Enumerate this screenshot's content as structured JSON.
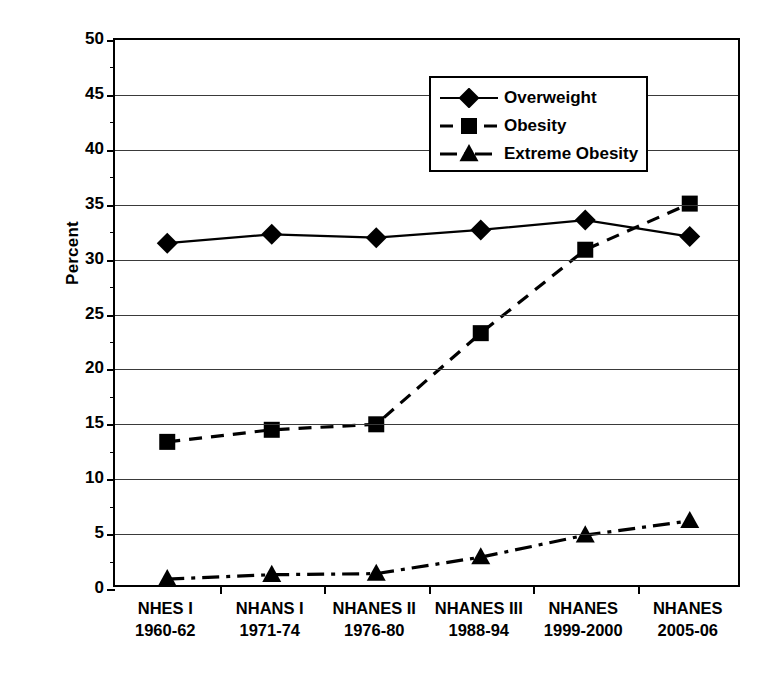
{
  "chart_data": {
    "type": "line",
    "title": "",
    "subtitle": "",
    "xlabel": "",
    "ylabel": "Percent",
    "ylim": [
      0,
      50
    ],
    "yticks": [
      0,
      5,
      10,
      15,
      20,
      25,
      30,
      35,
      40,
      45,
      50
    ],
    "ytick_labels": [
      "0",
      "5",
      "10",
      "15",
      "20",
      "25",
      "30",
      "35",
      "40",
      "45",
      "50"
    ],
    "grid": true,
    "legend_position": "upper center",
    "categories": [
      {
        "name": "NHES I",
        "years": "1960-62"
      },
      {
        "name": "NHANS I",
        "years": "1971-74"
      },
      {
        "name": "NHANES II",
        "years": "1976-80"
      },
      {
        "name": "NHANES III",
        "years": "1988-94"
      },
      {
        "name": "NHANES",
        "years": "1999-2000"
      },
      {
        "name": "NHANES",
        "years": "2005-06"
      }
    ],
    "category_labels": [
      "NHES I 1960-62",
      "NHANS I 1971-74",
      "NHANES II 1976-80",
      "NHANES III 1988-94",
      "NHANES 1999-2000",
      "NHANES 2005-06"
    ],
    "series": [
      {
        "name": "Overweight",
        "marker": "diamond",
        "linestyle": "solid",
        "color": "#000000",
        "values": [
          31.5,
          32.3,
          32.0,
          32.7,
          33.6,
          32.1
        ]
      },
      {
        "name": "Obesity",
        "marker": "square",
        "linestyle": "dashed",
        "color": "#000000",
        "values": [
          13.4,
          14.5,
          15.0,
          23.3,
          30.9,
          35.1
        ]
      },
      {
        "name": "Extreme Obesity",
        "marker": "triangle",
        "linestyle": "dashdot",
        "color": "#000000",
        "values": [
          0.9,
          1.3,
          1.4,
          2.9,
          4.9,
          6.2
        ]
      }
    ]
  },
  "legend": {
    "items": [
      {
        "label": "Overweight",
        "marker": "diamond",
        "linestyle": "solid"
      },
      {
        "label": "Obesity",
        "marker": "square",
        "linestyle": "dashed"
      },
      {
        "label": "Extreme Obesity",
        "marker": "triangle",
        "linestyle": "dashdot"
      }
    ]
  },
  "colors": {
    "ink": "#000000",
    "gridline": "#3a3a3a",
    "background": "#ffffff"
  }
}
